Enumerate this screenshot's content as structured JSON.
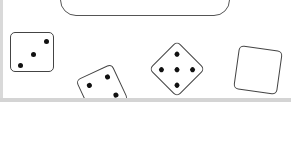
{
  "message": "The total is 13.",
  "dice": [
    {
      "name": "die-three",
      "value": 3
    },
    {
      "name": "die-four",
      "value": 4
    },
    {
      "name": "die-five",
      "value": 5
    },
    {
      "name": "die-blank",
      "value": 0
    }
  ]
}
